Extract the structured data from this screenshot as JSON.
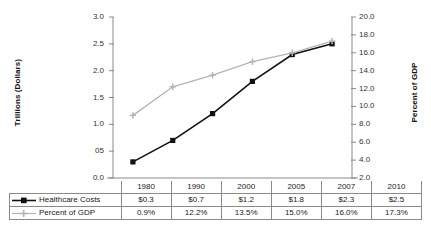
{
  "chart_data": {
    "type": "line",
    "title": "",
    "subtitle": "",
    "xlabel": "",
    "categories": [
      "1980",
      "1990",
      "2000",
      "2005",
      "2007",
      "2010"
    ],
    "grid": false,
    "legend_position": "bottom-table",
    "axes": {
      "left": {
        "label": "Trillions (Dollars)",
        "ylim": [
          0.0,
          3.0
        ],
        "ticks": [
          "0.0",
          "05",
          "1.0",
          "1.5",
          "2.0",
          "2.5",
          "3.0"
        ],
        "tick_values": [
          0.0,
          0.5,
          1.0,
          1.5,
          2.0,
          2.5,
          3.0
        ]
      },
      "right": {
        "label": "Percent of GDP",
        "ylim": [
          2.0,
          20.0
        ],
        "ticks": [
          "2.0",
          "4.0",
          "6.0",
          "8.0",
          "10.0",
          "12.0",
          "14.0",
          "16.0",
          "18.0",
          "20.0"
        ],
        "tick_values": [
          2.0,
          4.0,
          6.0,
          8.0,
          10.0,
          12.0,
          14.0,
          16.0,
          18.0,
          20.0
        ]
      }
    },
    "series": [
      {
        "name": "Healthcare Costs",
        "axis": "left",
        "color": "#111111",
        "marker": "square",
        "values": [
          0.3,
          0.7,
          1.2,
          1.8,
          2.3,
          2.5
        ],
        "labels": [
          "$0.3",
          "$0.7",
          "$1.2",
          "$1.8",
          "$2.3",
          "$2.5"
        ]
      },
      {
        "name": "Percent of GDP",
        "axis": "right",
        "color": "#b4b4b4",
        "marker": "plus",
        "values": [
          9.0,
          12.2,
          13.5,
          15.0,
          16.0,
          17.3
        ],
        "labels": [
          "0.9%",
          "12.2%",
          "13.5%",
          "15.0%",
          "16.0%",
          "17.3%"
        ]
      }
    ]
  },
  "table": {
    "year_header": [
      "1980",
      "1990",
      "2000",
      "2005",
      "2007",
      "2010"
    ],
    "rows": [
      {
        "label": "Healthcare Costs",
        "marker": "square-line-marker",
        "cells": [
          "$0.3",
          "$0.7",
          "$1.2",
          "$1.8",
          "$2.3",
          "$2.5"
        ]
      },
      {
        "label": "Percent of GDP",
        "marker": "plus-line-marker",
        "cells": [
          "0.9%",
          "12.2%",
          "13.5%",
          "15.0%",
          "16.0%",
          "17.3%"
        ]
      }
    ]
  },
  "colors": {
    "series_primary": "#111111",
    "series_secondary": "#b4b4b4",
    "axis": "#8a8a8a",
    "grid_border": "#8a8a8a",
    "text": "#1a1a1a"
  }
}
